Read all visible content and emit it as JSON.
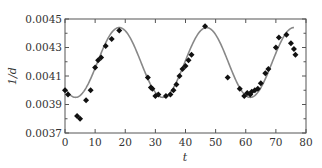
{
  "chart_data": {
    "type": "scatter",
    "title": "",
    "xlabel": "t",
    "ylabel": "1/d",
    "xlim": [
      0,
      80
    ],
    "ylim": [
      0.0037,
      0.0045
    ],
    "xticks": [
      0,
      10,
      20,
      30,
      40,
      50,
      60,
      70,
      80
    ],
    "xtick_labels": [
      "0",
      "10",
      "20",
      "30",
      "40",
      "50",
      "60",
      "70",
      "80"
    ],
    "yticks": [
      0.0037,
      0.0039,
      0.0041,
      0.0043,
      0.0045
    ],
    "ytick_labels": [
      "0.0037",
      "0.0039",
      "0.0041",
      "0.0043",
      "0.0045"
    ],
    "grid": false,
    "legend": null,
    "series": [
      {
        "name": "observed",
        "kind": "scatter",
        "marker": "diamond",
        "color": "#111111",
        "x": [
          0,
          1,
          4,
          5,
          7,
          8.5,
          10,
          11,
          12,
          13.5,
          15.5,
          18,
          27.5,
          28.5,
          29,
          30,
          31,
          33.5,
          35,
          36,
          37,
          38,
          39,
          40,
          41,
          42,
          46.5,
          54,
          58,
          59.5,
          60.5,
          61.5,
          62,
          63,
          64,
          65,
          66.5,
          67.5,
          70,
          71,
          73.5,
          75,
          76,
          76.5
        ],
        "y": [
          0.004,
          0.00397,
          0.00382,
          0.0038,
          0.00393,
          0.004,
          0.00416,
          0.00421,
          0.00423,
          0.00431,
          0.00436,
          0.00442,
          0.00409,
          0.00402,
          0.00401,
          0.00396,
          0.00397,
          0.00396,
          0.00397,
          0.004,
          0.00404,
          0.0041,
          0.00415,
          0.00417,
          0.00421,
          0.00425,
          0.00445,
          0.00409,
          0.00401,
          0.00396,
          0.00398,
          0.00397,
          0.00399,
          0.004,
          0.00401,
          0.00405,
          0.00412,
          0.00415,
          0.0043,
          0.00437,
          0.00439,
          0.00433,
          0.00429,
          0.00425
        ]
      },
      {
        "name": "model",
        "kind": "line",
        "color": "#888888",
        "function": "0.004195 + 0.000245*sin(2*pi*(t - 10.75)/29)",
        "t_range": [
          0,
          76
        ]
      }
    ]
  }
}
